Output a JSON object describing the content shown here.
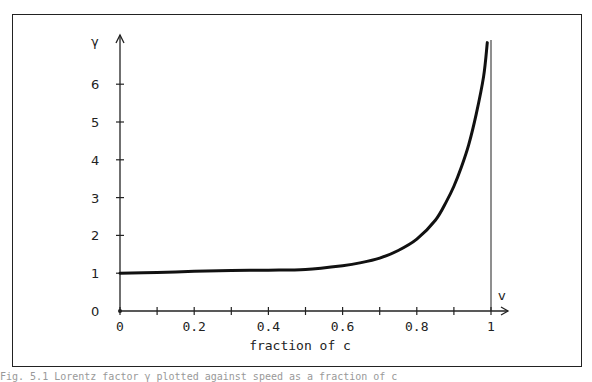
{
  "chart_data": {
    "type": "line",
    "title": "",
    "xlabel": "fraction of c",
    "ylabel": "γ",
    "x_axis_end_label": "v",
    "xlim": [
      0,
      1
    ],
    "ylim": [
      0,
      7
    ],
    "x_ticks": [
      0,
      0.1,
      0.2,
      0.3,
      0.4,
      0.5,
      0.6,
      0.7,
      0.8,
      0.9,
      1.0
    ],
    "x_tick_labels": [
      "0",
      "0.2",
      "0.4",
      "0.6",
      "0.8",
      "1"
    ],
    "y_ticks": [
      0,
      1,
      2,
      3,
      4,
      5,
      6
    ],
    "y_tick_labels": [
      "0",
      "1",
      "2",
      "3",
      "4",
      "5",
      "6"
    ],
    "grid": false,
    "legend": null,
    "series": [
      {
        "name": "γ (Lorentz factor)",
        "x": [
          0,
          0.1,
          0.2,
          0.3,
          0.4,
          0.5,
          0.6,
          0.65,
          0.7,
          0.75,
          0.8,
          0.85,
          0.88,
          0.9,
          0.92,
          0.94,
          0.96,
          0.98,
          0.99
        ],
        "y": [
          1.0,
          1.02,
          1.05,
          1.07,
          1.08,
          1.1,
          1.2,
          1.28,
          1.4,
          1.6,
          1.9,
          2.4,
          2.9,
          3.3,
          3.8,
          4.4,
          5.2,
          6.2,
          7.1
        ]
      }
    ],
    "vertical_line_at_x": 1
  },
  "caption": "Fig. 5.1  Lorentz factor γ plotted against speed as a fraction of c"
}
